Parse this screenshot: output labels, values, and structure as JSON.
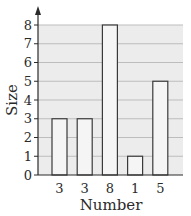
{
  "chart_data": {
    "type": "bar",
    "title": "",
    "xlabel": "Number",
    "ylabel": "Size",
    "categories": [
      "3",
      "3",
      "8",
      "1",
      "5"
    ],
    "values": [
      3,
      3,
      8,
      1,
      5
    ],
    "ylim": [
      0,
      8
    ],
    "yticks": [
      0,
      1,
      2,
      3,
      4,
      5,
      6,
      7,
      8
    ],
    "grid": true,
    "legend": null
  },
  "colors": {
    "plot_background": "#ececec",
    "bar_fill": "#f5f5f5",
    "bar_stroke": "#3a3a3a",
    "grid": "#bdbdbd",
    "axis": "#2a2a2a"
  }
}
